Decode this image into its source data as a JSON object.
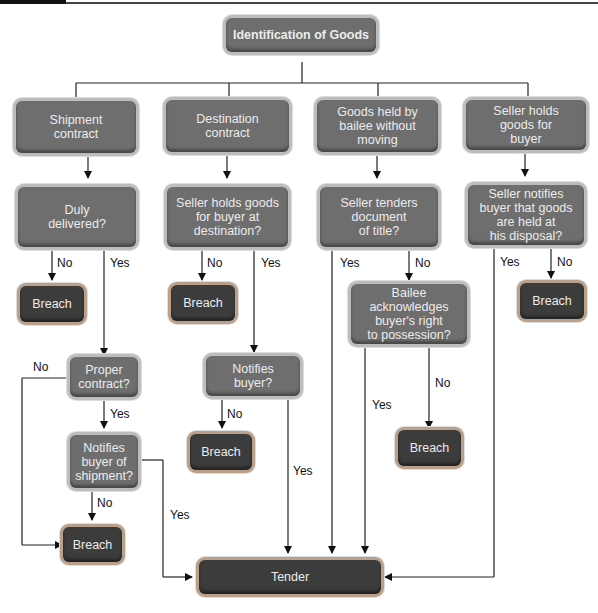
{
  "diagram": {
    "title": "Identification of Goods",
    "columns": [
      {
        "label": "Shipment\ncontract"
      },
      {
        "label": "Destination\ncontract"
      },
      {
        "label": "Goods held by\nbailee without\nmoving"
      },
      {
        "label": "Seller holds\ngoods for\nbuyer"
      }
    ],
    "questions": {
      "duly_delivered": "Duly\ndelivered?",
      "seller_holds_dest": "Seller holds goods\nfor buyer at\ndestination?",
      "tenders_document": "Seller tenders\ndocument\nof title?",
      "notifies_disposal": "Seller notifies\nbuyer that goods\nare held at\nhis disposal?",
      "bailee_acknowledges": "Bailee\nacknowledges\nbuyer's right\nto possession?",
      "proper_contract": "Proper\ncontract?",
      "notifies_buyer": "Notifies\nbuyer?",
      "notifies_shipment": "Notifies\nbuyer of\nshipment?"
    },
    "outcomes": {
      "breach": "Breach",
      "tender": "Tender"
    },
    "edge_labels": {
      "yes": "Yes",
      "no": "No"
    }
  }
}
